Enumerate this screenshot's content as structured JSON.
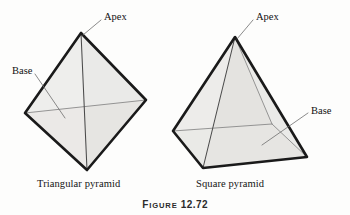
{
  "figure": {
    "caption_prefix_lead": "F",
    "caption_prefix_rest": "IGURE",
    "caption_number": "12.72",
    "caption_full": "FIGURE 12.72"
  },
  "shapes": [
    {
      "id": "triangular-pyramid",
      "caption": "Triangular pyramid",
      "callouts": [
        {
          "name": "apex",
          "label": "Apex"
        },
        {
          "name": "base",
          "label": "Base"
        }
      ]
    },
    {
      "id": "square-pyramid",
      "caption": "Square pyramid",
      "callouts": [
        {
          "name": "apex",
          "label": "Apex"
        },
        {
          "name": "base",
          "label": "Base"
        }
      ]
    }
  ],
  "colors": {
    "page_background": "#fdfdfc",
    "face_light": "#f0efed",
    "face_mid": "#e6e5e2",
    "face_dark": "#dcdbd8",
    "outline": "#1a1a1a",
    "interior_edge": "#4a4a4a",
    "hidden_edge": "#8a8a8a",
    "leader_line": "#6d6d6d",
    "text": "#111111"
  }
}
